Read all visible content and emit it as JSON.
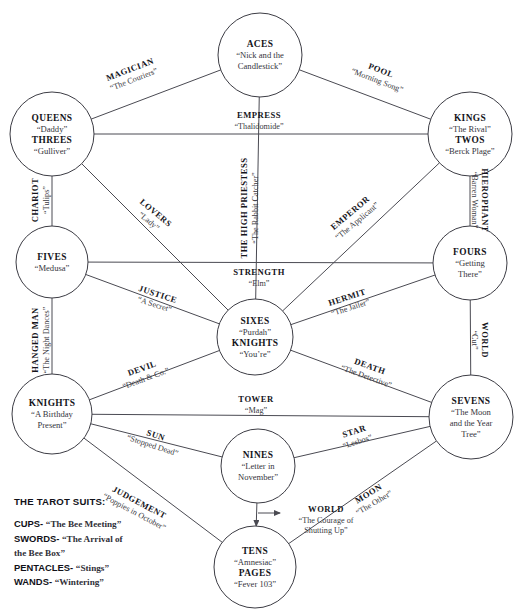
{
  "diagram": {
    "legend": {
      "heading": "THE TAROT SUITS:",
      "suits": [
        {
          "suit": "CUPS-",
          "work": "“The Bee Meeting”"
        },
        {
          "suit": "SWORDS-",
          "work": "“The Arrival of"
        },
        {
          "suit": "",
          "work": "the Bee Box”"
        },
        {
          "suit": "PENTACLES-",
          "work": "“Stings”"
        },
        {
          "suit": "WANDS-",
          "work": "“Wintering”"
        }
      ]
    },
    "nodes": [
      {
        "id": "aces",
        "cx": 260,
        "cy": 55,
        "r": 42,
        "lines": [
          {
            "text": "ACES",
            "style": "name"
          },
          {
            "text": "“Nick and the",
            "style": "poem"
          },
          {
            "text": "Candlestick”",
            "style": "poem"
          }
        ]
      },
      {
        "id": "queens-threes",
        "cx": 52,
        "cy": 134,
        "r": 42,
        "lines": [
          {
            "text": "QUEENS",
            "style": "name"
          },
          {
            "text": "“Daddy”",
            "style": "poem"
          },
          {
            "text": "THREES",
            "style": "name"
          },
          {
            "text": "“Gulliver”",
            "style": "poem"
          }
        ]
      },
      {
        "id": "kings-twos",
        "cx": 470,
        "cy": 134,
        "r": 42,
        "lines": [
          {
            "text": "KINGS",
            "style": "name"
          },
          {
            "text": "“The Rival”",
            "style": "poem"
          },
          {
            "text": "TWOS",
            "style": "name"
          },
          {
            "text": "“Berck Plage”",
            "style": "poem"
          }
        ]
      },
      {
        "id": "fives",
        "cx": 52,
        "cy": 262,
        "r": 36,
        "lines": [
          {
            "text": "FIVES",
            "style": "name"
          },
          {
            "text": "“Medusa”",
            "style": "poem"
          }
        ]
      },
      {
        "id": "fours",
        "cx": 470,
        "cy": 263,
        "r": 37,
        "lines": [
          {
            "text": "FOURS",
            "style": "name"
          },
          {
            "text": "“Getting",
            "style": "poem"
          },
          {
            "text": "There”",
            "style": "poem"
          }
        ]
      },
      {
        "id": "sixes-knights",
        "cx": 255,
        "cy": 337,
        "r": 38,
        "lines": [
          {
            "text": "SIXES",
            "style": "name"
          },
          {
            "text": "“Purdah”",
            "style": "poem"
          },
          {
            "text": "KNIGHTS",
            "style": "name"
          },
          {
            "text": "“You’re”",
            "style": "poem"
          }
        ]
      },
      {
        "id": "knights-left",
        "cx": 52,
        "cy": 414,
        "r": 40,
        "lines": [
          {
            "text": "KNIGHTS",
            "style": "name"
          },
          {
            "text": "“A Birthday",
            "style": "poem"
          },
          {
            "text": "Present”",
            "style": "poem"
          }
        ]
      },
      {
        "id": "sevens",
        "cx": 471,
        "cy": 417,
        "r": 42,
        "lines": [
          {
            "text": "SEVENS",
            "style": "name"
          },
          {
            "text": "“The Moon",
            "style": "poem"
          },
          {
            "text": "and the Year",
            "style": "poem"
          },
          {
            "text": "Tree”",
            "style": "poem"
          }
        ]
      },
      {
        "id": "nines",
        "cx": 258,
        "cy": 466,
        "r": 37,
        "lines": [
          {
            "text": "NINES",
            "style": "name"
          },
          {
            "text": "“Letter in",
            "style": "poem"
          },
          {
            "text": "November”",
            "style": "poem"
          }
        ]
      },
      {
        "id": "tens-pages",
        "cx": 255,
        "cy": 567,
        "r": 41,
        "lines": [
          {
            "text": "TENS",
            "style": "name"
          },
          {
            "text": "“Amnesiac”",
            "style": "poem"
          },
          {
            "text": "PAGES",
            "style": "name"
          },
          {
            "text": "“Fever 103”",
            "style": "poem"
          }
        ]
      }
    ],
    "edges": [
      {
        "id": "magician",
        "from": "queens-threes",
        "to": "aces",
        "name": "MAGICIAN",
        "poem": "“The Couriers”",
        "label_x": 131,
        "label_y": 72,
        "rotate": -21
      },
      {
        "id": "pool",
        "from": "aces",
        "to": "kings-twos",
        "name": "POOL",
        "poem": "“Morning Song”",
        "label_x": 380,
        "label_y": 73,
        "rotate": 21
      },
      {
        "id": "empress",
        "from": "queens-threes",
        "to": "kings-twos",
        "name": "EMPRESS",
        "poem": "“Thalidomide”",
        "label_x": 259,
        "label_y": 118,
        "rotate": 0
      },
      {
        "id": "high-priestess",
        "from": "aces",
        "to": "sixes-knights",
        "name": "THE HIGH PRIESTESS",
        "poem": "“The Rabbit Catcher”",
        "label_x": 247,
        "label_y": 208,
        "rotate": -90
      },
      {
        "id": "chariot",
        "from": "queens-threes",
        "to": "fives",
        "name": "CHARIOT",
        "poem": "“Tulips”",
        "label_x": 38,
        "label_y": 200,
        "rotate": -90
      },
      {
        "id": "hierophant",
        "from": "kings-twos",
        "to": "fours",
        "name": "HIEROPHANT",
        "poem": "“Barren Woman”",
        "label_x": 482,
        "label_y": 200,
        "rotate": 90
      },
      {
        "id": "lovers",
        "from": "queens-threes",
        "to": "sixes-knights",
        "name": "LOVERS",
        "poem": "“Lady”",
        "label_x": 154,
        "label_y": 215,
        "rotate": 40
      },
      {
        "id": "emperor",
        "from": "kings-twos",
        "to": "sixes-knights",
        "name": "EMPEROR",
        "poem": "“The Applicant”",
        "label_x": 352,
        "label_y": 215,
        "rotate": -40
      },
      {
        "id": "strength",
        "from": "fives",
        "to": "fours",
        "name": "STRENGTH",
        "poem": "“Elm”",
        "label_x": 259,
        "label_y": 275,
        "rotate": 0
      },
      {
        "id": "justice",
        "from": "fives",
        "to": "sixes-knights",
        "name": "JUSTICE",
        "poem": "“A Secret”",
        "label_x": 157,
        "label_y": 297,
        "rotate": 18
      },
      {
        "id": "hermit",
        "from": "fours",
        "to": "sixes-knights",
        "name": "HERMIT",
        "poem": "“The Jailer”",
        "label_x": 348,
        "label_y": 300,
        "rotate": -18
      },
      {
        "id": "hanged-man",
        "from": "fives",
        "to": "knights-left",
        "name": "HANGED MAN",
        "poem": "“The Night Dances”",
        "label_x": 38,
        "label_y": 340,
        "rotate": -90
      },
      {
        "id": "world-right",
        "from": "fours",
        "to": "sevens",
        "name": "WORLD",
        "poem": "“Cut”",
        "label_x": 482,
        "label_y": 340,
        "rotate": 90
      },
      {
        "id": "devil",
        "from": "knights-left",
        "to": "sixes-knights",
        "name": "DEVIL",
        "poem": "“Death & Co.”",
        "label_x": 143,
        "label_y": 371,
        "rotate": -20
      },
      {
        "id": "death",
        "from": "sixes-knights",
        "to": "sevens",
        "name": "DEATH",
        "poem": "“The Detective”",
        "label_x": 369,
        "label_y": 369,
        "rotate": 20
      },
      {
        "id": "tower",
        "from": "knights-left",
        "to": "sevens",
        "name": "TOWER",
        "poem": "“Mag”",
        "label_x": 256,
        "label_y": 402,
        "rotate": 0
      },
      {
        "id": "sun",
        "from": "knights-left",
        "to": "nines",
        "name": "SUN",
        "poem": "“Stopped Dead”",
        "label_x": 155,
        "label_y": 438,
        "rotate": 18
      },
      {
        "id": "star",
        "from": "nines",
        "to": "sevens",
        "name": "STAR",
        "poem": "“Lesbos”",
        "label_x": 355,
        "label_y": 434,
        "rotate": -18
      },
      {
        "id": "judgement",
        "from": "knights-left",
        "to": "tens-pages",
        "name": "JUDGEMENT",
        "poem": "“Poppies in October”",
        "label_x": 138,
        "label_y": 505,
        "rotate": 28
      },
      {
        "id": "world-center",
        "from": "nines",
        "to": "tens-pages",
        "name": "WORLD",
        "poem": "“The Courage of Shutting Up”",
        "label_x": 326,
        "label_y": 512,
        "rotate": 0,
        "poem_lines": [
          "“The Courage of",
          "Shutting Up”"
        ],
        "has_arrow": true
      },
      {
        "id": "moon",
        "from": "tens-pages",
        "to": "sevens",
        "name": "MOON",
        "poem": "“The Other”",
        "label_x": 370,
        "label_y": 496,
        "rotate": -31
      }
    ]
  }
}
